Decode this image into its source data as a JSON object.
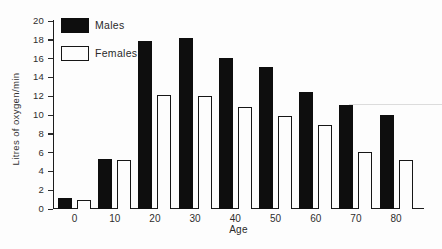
{
  "figure": {
    "background": "#fdfdfd",
    "axis_color": "#1c1c1c",
    "text_color": "#2a2a2a",
    "male_bar_color": "#0e0e0e",
    "female_bar_fill": "#fdfdfd",
    "female_bar_border": "#161616",
    "artifact_line_color": "#dcdcdc"
  },
  "chart_data": {
    "type": "bar",
    "title": "",
    "xlabel": "Age",
    "ylabel": "Litres of oxygen/min",
    "categories": [
      "0",
      "10",
      "20",
      "30",
      "40",
      "50",
      "60",
      "70",
      "80"
    ],
    "series": [
      {
        "name": "Males",
        "color": "#0e0e0e",
        "values": [
          1.2,
          5.3,
          17.9,
          18.2,
          16.1,
          15.1,
          12.4,
          11.1,
          10.0
        ]
      },
      {
        "name": "Females",
        "color": "#fdfdfd",
        "values": [
          1.0,
          5.2,
          12.1,
          12.0,
          10.9,
          9.9,
          8.9,
          6.1,
          5.2
        ]
      }
    ],
    "ylim": [
      0,
      20
    ],
    "yticks": [
      0,
      2,
      4,
      6,
      8,
      10,
      12,
      14,
      16,
      18,
      20
    ],
    "grid": false,
    "legend_position": "top-left-inside"
  }
}
